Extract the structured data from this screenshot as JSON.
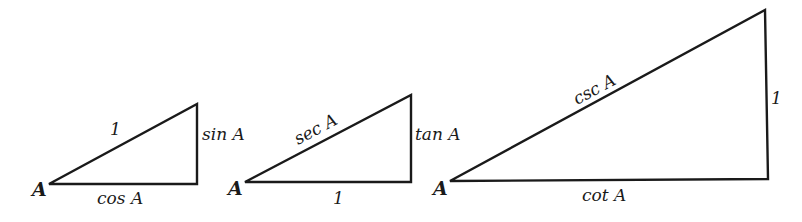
{
  "diagram": {
    "triangles": [
      {
        "id": "unit-hypotenuse",
        "vertex_label": "A",
        "hypotenuse": "1",
        "opposite": "sin A",
        "adjacent": "cos A"
      },
      {
        "id": "unit-adjacent",
        "vertex_label": "A",
        "hypotenuse": "sec A",
        "opposite": "tan A",
        "adjacent": "1"
      },
      {
        "id": "unit-opposite",
        "vertex_label": "A",
        "hypotenuse": "csc A",
        "opposite": "1",
        "adjacent": "cot A"
      }
    ]
  }
}
